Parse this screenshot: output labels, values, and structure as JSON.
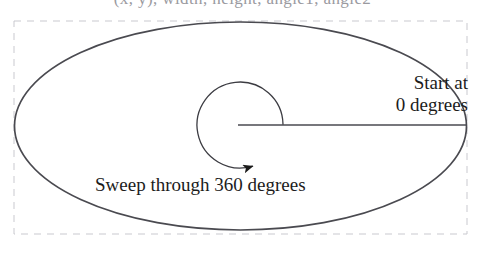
{
  "figure": {
    "top_clipped_caption": "(x, y), width, height, angle1, angle2",
    "background_color": "#ffffff",
    "border": {
      "style": "dashed",
      "color": "#c9c9cf",
      "x": 14,
      "y": 21,
      "width": 453,
      "height": 213
    },
    "ellipse": {
      "stroke_color": "#4a4a50",
      "stroke_width": 1.7,
      "center_x": 240.5,
      "center_y": 126,
      "radius_x": 226,
      "radius_y": 104
    },
    "radius_line": {
      "stroke_color": "#4a4a50",
      "stroke_width": 1.4,
      "x1": 238,
      "y1": 125,
      "x2": 467,
      "y2": 125
    },
    "sweep_arc": {
      "stroke_color": "#3c3c42",
      "stroke_width": 1.3,
      "center_x": 240,
      "center_y": 125,
      "radius": 43,
      "direction": "counterclockwise",
      "start_degrees": 0,
      "end_degrees": 360,
      "arrowhead_x": 266,
      "arrowhead_y": 166
    },
    "labels": {
      "start": {
        "line1": "Start at",
        "line2": "0 degrees"
      },
      "sweep": "Sweep through 360 degrees"
    }
  }
}
